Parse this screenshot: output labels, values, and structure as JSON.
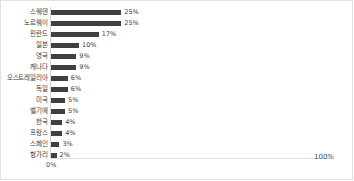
{
  "chart_data": {
    "type": "bar",
    "orientation": "horizontal",
    "title": "",
    "subtitle": "",
    "xlabel": "",
    "ylabel": "",
    "xlim": [
      0,
      100
    ],
    "grid": false,
    "legend": null,
    "value_suffix": "%",
    "bar_color": "#404040",
    "categories": [
      "스웨덴",
      "노르웨이",
      "핀란드",
      "일본",
      "영국",
      "캐나다",
      "오스트레일리아",
      "독일",
      "미국",
      "벨기에",
      "한국",
      "프랑스",
      "스페인",
      "헝가리"
    ],
    "values": [
      25,
      25,
      17,
      10,
      9,
      9,
      6,
      6,
      5,
      5,
      4,
      4,
      3,
      2
    ],
    "data_labels": [
      "25%",
      "25%",
      "17%",
      "10%",
      "9%",
      "9%",
      "6%",
      "6%",
      "5%",
      "5%",
      "4%",
      "4%",
      "3%",
      "2%"
    ]
  },
  "axis": {
    "start_tick": "0%",
    "end_tick": "100%"
  }
}
